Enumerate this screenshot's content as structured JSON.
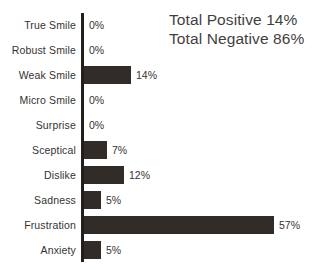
{
  "chart_data": {
    "type": "bar",
    "orientation": "horizontal",
    "title": "",
    "xlabel": "",
    "ylabel": "",
    "categories": [
      "True Smile",
      "Robust Smile",
      "Weak Smile",
      "Micro Smile",
      "Surprise",
      "Sceptical",
      "Dislike",
      "Sadness",
      "Frustration",
      "Anxiety"
    ],
    "values": [
      0,
      0,
      14,
      0,
      0,
      7,
      12,
      5,
      57,
      5
    ],
    "value_labels": [
      "0%",
      "0%",
      "14%",
      "0%",
      "0%",
      "7%",
      "12%",
      "5%",
      "57%",
      "5%"
    ],
    "xlim": [
      0,
      60
    ],
    "grid": false,
    "legend": null,
    "bar_color": "#322c28",
    "axis_color": "#231f1c",
    "background": "#ffffff",
    "text_color": "#333333"
  },
  "annotations": {
    "total_positive": "Total Positive 14%",
    "total_negative": "Total Negative 86%"
  }
}
